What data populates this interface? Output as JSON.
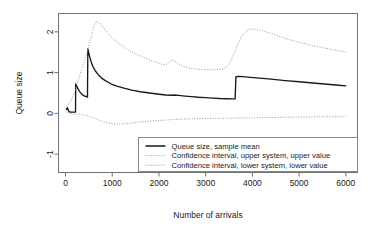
{
  "chart_data": {
    "type": "line",
    "title": "",
    "xlabel": "Number of arrivals",
    "ylabel": "Queue size",
    "xlim": [
      -150,
      6250
    ],
    "ylim": [
      -1.45,
      2.45
    ],
    "xticks": [
      0,
      1000,
      2000,
      3000,
      4000,
      5000,
      6000
    ],
    "xtick_labels": [
      "0",
      "1000",
      "2000",
      "3000",
      "4000",
      "5000",
      "6000"
    ],
    "yticks": [
      -1,
      0,
      1,
      2
    ],
    "ytick_labels": [
      "-1",
      "0",
      "1",
      "2"
    ],
    "grid": false,
    "legend_position": "bottom-right",
    "series": [
      {
        "name": "Queue size, sample mean",
        "style": "solid",
        "color": "#1a1a1a",
        "points": [
          [
            20,
            0.1
          ],
          [
            40,
            0.14
          ],
          [
            60,
            0.07
          ],
          [
            80,
            0.04
          ],
          [
            110,
            0.03
          ],
          [
            150,
            0.03
          ],
          [
            190,
            0.03
          ],
          [
            215,
            0.03
          ],
          [
            218,
            0.72
          ],
          [
            235,
            0.68
          ],
          [
            260,
            0.62
          ],
          [
            290,
            0.56
          ],
          [
            320,
            0.51
          ],
          [
            350,
            0.47
          ],
          [
            380,
            0.44
          ],
          [
            420,
            0.42
          ],
          [
            455,
            0.41
          ],
          [
            470,
            0.4
          ],
          [
            478,
            1.58
          ],
          [
            495,
            1.5
          ],
          [
            520,
            1.38
          ],
          [
            550,
            1.26
          ],
          [
            590,
            1.14
          ],
          [
            640,
            1.04
          ],
          [
            700,
            0.95
          ],
          [
            780,
            0.86
          ],
          [
            870,
            0.79
          ],
          [
            980,
            0.72
          ],
          [
            1100,
            0.67
          ],
          [
            1250,
            0.62
          ],
          [
            1420,
            0.57
          ],
          [
            1600,
            0.53
          ],
          [
            1800,
            0.5
          ],
          [
            2000,
            0.47
          ],
          [
            2150,
            0.45
          ],
          [
            2260,
            0.445
          ],
          [
            2330,
            0.45
          ],
          [
            2420,
            0.44
          ],
          [
            2560,
            0.425
          ],
          [
            2700,
            0.41
          ],
          [
            2850,
            0.395
          ],
          [
            3000,
            0.385
          ],
          [
            3150,
            0.375
          ],
          [
            3300,
            0.365
          ],
          [
            3450,
            0.36
          ],
          [
            3580,
            0.355
          ],
          [
            3630,
            0.355
          ],
          [
            3648,
            0.9
          ],
          [
            3700,
            0.905
          ],
          [
            3800,
            0.9
          ],
          [
            3950,
            0.885
          ],
          [
            4150,
            0.865
          ],
          [
            4400,
            0.84
          ],
          [
            4700,
            0.805
          ],
          [
            5000,
            0.775
          ],
          [
            5300,
            0.745
          ],
          [
            5600,
            0.715
          ],
          [
            5850,
            0.69
          ],
          [
            6000,
            0.675
          ]
        ]
      },
      {
        "name": "Confidence interval, upper system, upper value",
        "style": "dotted",
        "color": "#9a9a9a",
        "points": [
          [
            20,
            0.18
          ],
          [
            60,
            0.22
          ],
          [
            110,
            0.3
          ],
          [
            160,
            0.42
          ],
          [
            215,
            0.58
          ],
          [
            260,
            0.76
          ],
          [
            310,
            0.95
          ],
          [
            370,
            1.16
          ],
          [
            430,
            1.38
          ],
          [
            490,
            1.62
          ],
          [
            540,
            1.85
          ],
          [
            580,
            2.02
          ],
          [
            620,
            2.18
          ],
          [
            660,
            2.25
          ],
          [
            700,
            2.24
          ],
          [
            750,
            2.18
          ],
          [
            810,
            2.1
          ],
          [
            880,
            2.0
          ],
          [
            960,
            1.9
          ],
          [
            1050,
            1.8
          ],
          [
            1160,
            1.7
          ],
          [
            1280,
            1.6
          ],
          [
            1420,
            1.51
          ],
          [
            1570,
            1.42
          ],
          [
            1730,
            1.34
          ],
          [
            1900,
            1.27
          ],
          [
            2050,
            1.21
          ],
          [
            2160,
            1.19
          ],
          [
            2230,
            1.27
          ],
          [
            2290,
            1.3
          ],
          [
            2360,
            1.27
          ],
          [
            2450,
            1.19
          ],
          [
            2560,
            1.14
          ],
          [
            2700,
            1.1
          ],
          [
            2870,
            1.08
          ],
          [
            3050,
            1.07
          ],
          [
            3200,
            1.07
          ],
          [
            3330,
            1.08
          ],
          [
            3430,
            1.12
          ],
          [
            3520,
            1.25
          ],
          [
            3600,
            1.45
          ],
          [
            3680,
            1.68
          ],
          [
            3760,
            1.87
          ],
          [
            3840,
            1.99
          ],
          [
            3920,
            2.05
          ],
          [
            4000,
            2.07
          ],
          [
            4100,
            2.06
          ],
          [
            4230,
            2.02
          ],
          [
            4400,
            1.96
          ],
          [
            4600,
            1.88
          ],
          [
            4820,
            1.8
          ],
          [
            5050,
            1.73
          ],
          [
            5300,
            1.66
          ],
          [
            5550,
            1.6
          ],
          [
            5800,
            1.55
          ],
          [
            6000,
            1.51
          ]
        ]
      },
      {
        "name": "Confidence interval, lower system, lower value",
        "style": "dotted",
        "color": "#9a9a9a",
        "points": [
          [
            20,
            0.03
          ],
          [
            60,
            0.01
          ],
          [
            110,
            -0.01
          ],
          [
            170,
            -0.02
          ],
          [
            230,
            -0.02
          ],
          [
            300,
            -0.02
          ],
          [
            370,
            -0.03
          ],
          [
            450,
            -0.05
          ],
          [
            530,
            -0.08
          ],
          [
            620,
            -0.12
          ],
          [
            710,
            -0.16
          ],
          [
            800,
            -0.2
          ],
          [
            890,
            -0.23
          ],
          [
            980,
            -0.25
          ],
          [
            1070,
            -0.26
          ],
          [
            1170,
            -0.26
          ],
          [
            1280,
            -0.25
          ],
          [
            1400,
            -0.24
          ],
          [
            1550,
            -0.22
          ],
          [
            1700,
            -0.2
          ],
          [
            1880,
            -0.18
          ],
          [
            2080,
            -0.17
          ],
          [
            2300,
            -0.15
          ],
          [
            2550,
            -0.14
          ],
          [
            2800,
            -0.13
          ],
          [
            3050,
            -0.12
          ],
          [
            3300,
            -0.12
          ],
          [
            3550,
            -0.12
          ],
          [
            3800,
            -0.11
          ],
          [
            4050,
            -0.11
          ],
          [
            4300,
            -0.1
          ],
          [
            4600,
            -0.1
          ],
          [
            4900,
            -0.09
          ],
          [
            5200,
            -0.09
          ],
          [
            5500,
            -0.08
          ],
          [
            5800,
            -0.08
          ],
          [
            6000,
            -0.08
          ]
        ]
      }
    ]
  },
  "legend": {
    "entries": [
      "Queue size, sample mean",
      "Confidence interval, upper system, upper value",
      "Confidence interval, lower system, lower value"
    ]
  }
}
